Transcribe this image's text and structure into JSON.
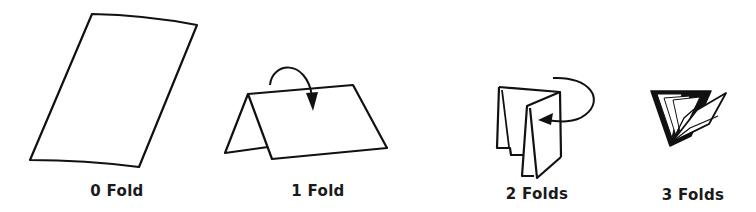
{
  "diagram": {
    "title": "",
    "panels": [
      {
        "id": "fold-0",
        "label": "0 Fold",
        "folds": 0,
        "has_arrow": false
      },
      {
        "id": "fold-1",
        "label": "1 Fold",
        "folds": 1,
        "has_arrow": true
      },
      {
        "id": "fold-2",
        "label": "2 Folds",
        "folds": 2,
        "has_arrow": true
      },
      {
        "id": "fold-3",
        "label": "3 Folds",
        "folds": 3,
        "has_arrow": false
      }
    ],
    "colors": {
      "stroke": "#111111",
      "background": "#ffffff"
    }
  }
}
